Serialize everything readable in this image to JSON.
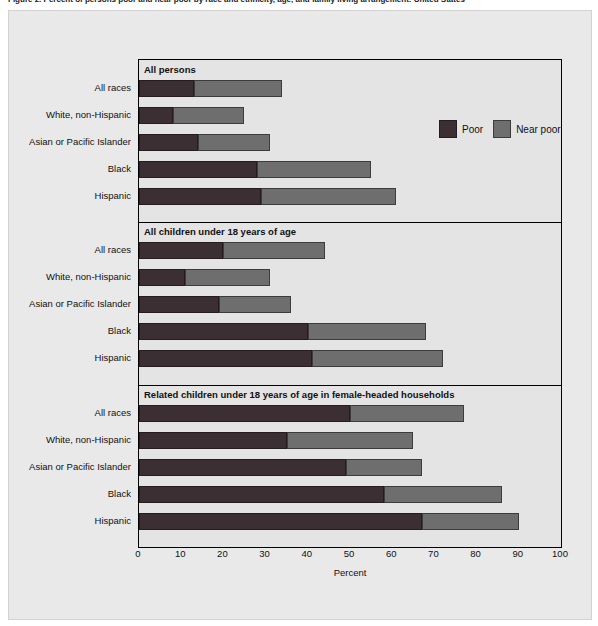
{
  "figure": {
    "caption": "Figure 2. Percent of persons poor and near poor by race and ethnicity, age, and family living arrangement: United States"
  },
  "legend": {
    "position": "top-right-inside-plot",
    "items": [
      {
        "label": "Poor",
        "color": "#3b2f33",
        "icon": "legend-swatch"
      },
      {
        "label": "Near poor",
        "color": "#6e6e6e",
        "icon": "legend-swatch"
      }
    ]
  },
  "axis": {
    "xlabel": "Percent",
    "ticks": [
      "0",
      "10",
      "20",
      "30",
      "40",
      "50",
      "60",
      "70",
      "80",
      "90",
      "100"
    ],
    "min": 0,
    "max": 100
  },
  "chart_data": {
    "type": "bar",
    "orientation": "horizontal",
    "stacked": true,
    "title": "Figure 2. Percent of persons poor and near poor by race and ethnicity, age, and family living arrangement: United States",
    "xlabel": "Percent",
    "ylabel": "",
    "xlim": [
      0,
      100
    ],
    "grid": false,
    "legend": [
      "Poor",
      "Near poor"
    ],
    "legend_position": "top right",
    "categories": [
      "All races",
      "White, non-Hispanic",
      "Asian or Pacific Islander",
      "Black",
      "Hispanic"
    ],
    "panels": [
      {
        "title": "All persons",
        "series": [
          {
            "name": "Poor",
            "values": [
              13,
              8,
              14,
              28,
              29
            ]
          },
          {
            "name": "Near poor",
            "values": [
              21,
              17,
              17,
              27,
              32
            ]
          }
        ],
        "totals": [
          34,
          25,
          31,
          55,
          61
        ]
      },
      {
        "title": "All children under 18 years of age",
        "series": [
          {
            "name": "Poor",
            "values": [
              20,
              11,
              19,
              40,
              41
            ]
          },
          {
            "name": "Near poor",
            "values": [
              24,
              20,
              17,
              28,
              31
            ]
          }
        ],
        "totals": [
          44,
          31,
          36,
          68,
          72
        ]
      },
      {
        "title": "Related children under 18 years of age in female-headed households",
        "series": [
          {
            "name": "Poor",
            "values": [
              50,
              35,
              49,
              58,
              67
            ]
          },
          {
            "name": "Near poor",
            "values": [
              27,
              30,
              18,
              28,
              23
            ]
          }
        ],
        "totals": [
          77,
          65,
          67,
          86,
          90
        ]
      }
    ]
  }
}
